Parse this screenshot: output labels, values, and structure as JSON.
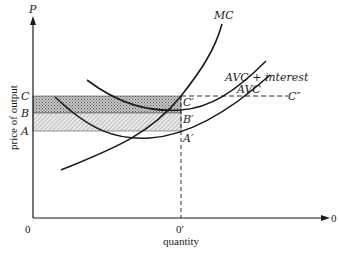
{
  "diagram": {
    "type": "cost-curves",
    "axes": {
      "y_axis_label": "price of output",
      "y_axis_symbol": "P",
      "x_axis_label": "quantity",
      "origin_label": "0",
      "x_axis_end_label": "0",
      "x_tick_label": "0′"
    },
    "price_levels": [
      {
        "label": "C"
      },
      {
        "label": "B"
      },
      {
        "label": "A"
      }
    ],
    "points": [
      {
        "label": "C′"
      },
      {
        "label": "B′"
      },
      {
        "label": "A′"
      }
    ],
    "curves": [
      {
        "label": "MC"
      },
      {
        "label": "AVC + interest"
      },
      {
        "label": "AVC"
      }
    ],
    "extension_label": "C″",
    "colors": {
      "line": "#1a1a1a",
      "shade_dark": "#9a9a9a",
      "shade_light": "#cfcfcf"
    }
  }
}
